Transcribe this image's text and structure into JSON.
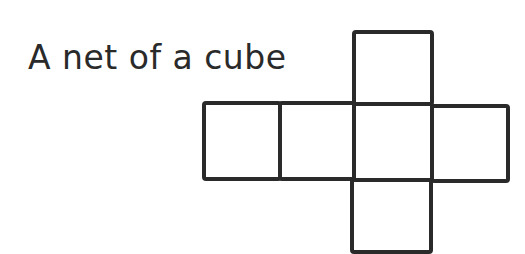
{
  "title": "A net of a cube",
  "diagram": {
    "stroke_color": "#2a2a2a",
    "background": "#ffffff",
    "faces": [
      {
        "name": "top",
        "x": 354,
        "y": 32,
        "w": 78,
        "h": 72
      },
      {
        "name": "left",
        "x": 204,
        "y": 103,
        "w": 76,
        "h": 76
      },
      {
        "name": "center-left",
        "x": 280,
        "y": 103,
        "w": 74,
        "h": 76
      },
      {
        "name": "center",
        "x": 354,
        "y": 104,
        "w": 78,
        "h": 76
      },
      {
        "name": "right",
        "x": 432,
        "y": 106,
        "w": 76,
        "h": 75
      },
      {
        "name": "bottom",
        "x": 352,
        "y": 180,
        "w": 79,
        "h": 72
      }
    ]
  }
}
